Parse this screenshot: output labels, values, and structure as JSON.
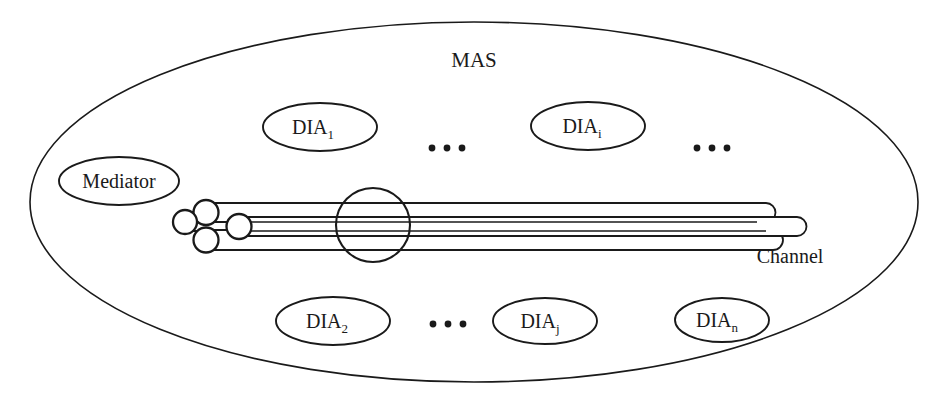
{
  "diagram": {
    "title": "MAS",
    "boundary_label": "MAS",
    "channel_label": "Channel",
    "stroke_color": "#1a1a1a",
    "background_color": "#ffffff",
    "mediator": {
      "label": "Mediator",
      "cx": 119,
      "cy": 181,
      "rx": 60,
      "ry": 24
    },
    "agents_top": [
      {
        "label": "DIA",
        "subscript": "1",
        "cx": 320,
        "cy": 127,
        "rx": 57,
        "ry": 24
      },
      {
        "label": "DIA",
        "subscript": "i",
        "cx": 588,
        "cy": 126,
        "rx": 57,
        "ry": 24
      }
    ],
    "agents_bottom": [
      {
        "label": "DIA",
        "subscript": "2",
        "cx": 333,
        "cy": 321,
        "rx": 57,
        "ry": 24
      },
      {
        "label": "DIA",
        "subscript": "j",
        "cx": 545,
        "cy": 321,
        "rx": 52,
        "ry": 23
      },
      {
        "label": "DIA",
        "subscript": "n",
        "cx": 722,
        "cy": 320,
        "rx": 47,
        "ry": 22
      }
    ],
    "ellipses_markers": [
      {
        "name": "ellipsis-top-left",
        "cx": 447,
        "cy": 148,
        "count": 3,
        "gap": 15,
        "r": 3.3
      },
      {
        "name": "ellipsis-top-right",
        "cx": 712,
        "cy": 148,
        "count": 3,
        "gap": 15,
        "r": 3.3
      },
      {
        "name": "ellipsis-bottom",
        "cx": 448,
        "cy": 324,
        "count": 3,
        "gap": 15,
        "r": 3.3
      }
    ],
    "outer_ellipse": {
      "cx": 474,
      "cy": 202,
      "rx": 444,
      "ry": 180
    },
    "channel": {
      "label": "Channel",
      "label_x": 790,
      "label_y": 263,
      "packet": {
        "cx": 373,
        "cy": 225,
        "r": 37
      },
      "tubes": [
        {
          "name": "tube-1",
          "left": 196,
          "right": 779,
          "top": 203,
          "bottom": 222,
          "cap_left": true
        },
        {
          "name": "tube-2",
          "left": 175,
          "right": 770,
          "top": 212,
          "bottom": 231,
          "cap_left": true
        },
        {
          "name": "tube-3",
          "left": 228,
          "right": 810,
          "top": 217,
          "bottom": 236,
          "cap_left": true
        },
        {
          "name": "tube-4",
          "left": 196,
          "right": 786,
          "top": 230,
          "bottom": 250,
          "cap_left": true
        }
      ],
      "left_caps": [
        {
          "name": "cap-top",
          "cx": 206,
          "cy": 212,
          "r": 12.5
        },
        {
          "name": "cap-mid-left",
          "cx": 185,
          "cy": 222,
          "r": 12.5
        },
        {
          "name": "cap-mid-right",
          "cx": 239,
          "cy": 227,
          "r": 12.5
        },
        {
          "name": "cap-bottom",
          "cx": 206,
          "cy": 240,
          "r": 12.5
        }
      ]
    }
  }
}
